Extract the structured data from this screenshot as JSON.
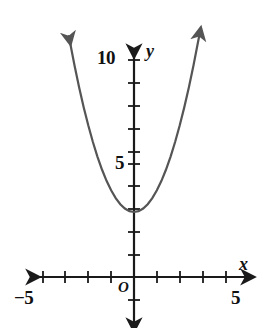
{
  "figure": {
    "kind": "coordinate-plane-graph",
    "background": "#ffffff",
    "curve_color": "#555555",
    "axis_color": "#1a1a1a"
  },
  "labels": {
    "y_10": "10",
    "y_5": "5",
    "x_neg5": "−5",
    "x_5": "5",
    "y_axis_name": "y",
    "x_axis_name": "x",
    "origin": "O"
  },
  "chart_data": {
    "type": "line",
    "title": "",
    "xlabel": "x",
    "ylabel": "y",
    "grid": false,
    "legend": null,
    "xlim": [
      -5.6,
      5.6
    ],
    "ylim": [
      -2.2,
      11.6
    ],
    "xticks": [
      -5,
      -4,
      -3,
      -2,
      -1,
      0,
      1,
      2,
      3,
      4,
      5
    ],
    "yticks": [
      -1,
      1,
      2,
      3,
      4,
      5,
      6,
      7,
      8,
      9,
      10
    ],
    "xtick_labels_shown": [
      "−5",
      "5"
    ],
    "ytick_labels_shown": [
      "5",
      "10"
    ],
    "axes_arrows": [
      "left",
      "right",
      "up",
      "down"
    ],
    "series": [
      {
        "name": "parabola",
        "equation": "y = x^2 + 3",
        "vertex": [
          0,
          3
        ],
        "arrowheads": [
          "start",
          "end"
        ],
        "x": [
          -2.85,
          -2.6,
          -2.4,
          -2.2,
          -2.0,
          -1.8,
          -1.6,
          -1.4,
          -1.2,
          -1.0,
          -0.8,
          -0.6,
          -0.4,
          -0.2,
          0,
          0.2,
          0.4,
          0.6,
          0.8,
          1.0,
          1.2,
          1.4,
          1.6,
          1.8,
          2.0,
          2.2,
          2.4,
          2.6,
          2.85
        ],
        "y": [
          11.12,
          9.76,
          8.76,
          7.84,
          7.0,
          6.24,
          5.56,
          4.96,
          4.44,
          4.0,
          3.64,
          3.36,
          3.16,
          3.04,
          3.0,
          3.04,
          3.16,
          3.36,
          3.64,
          4.0,
          4.44,
          4.96,
          5.56,
          6.24,
          7.0,
          7.84,
          8.76,
          9.76,
          11.12
        ]
      }
    ]
  }
}
